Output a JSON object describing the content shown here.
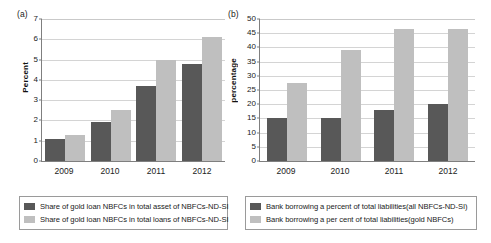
{
  "chart_data": [
    {
      "type": "bar",
      "panel_tag": "(a)",
      "title": "",
      "xlabel": "",
      "ylabel": "Percent",
      "categories": [
        "2009",
        "2010",
        "2011",
        "2012"
      ],
      "ylim": [
        0,
        7
      ],
      "yticks": [
        0,
        1,
        2,
        3,
        4,
        5,
        6,
        7
      ],
      "grid": true,
      "legend_position": "bottom",
      "colors": [
        "#585858",
        "#bfbfbf"
      ],
      "series": [
        {
          "name": "Share of gold loan NBFCs in total asset of NBFCs-ND-SI",
          "values": [
            1.1,
            1.9,
            3.7,
            4.8
          ]
        },
        {
          "name": "Share of gold loan NBFCs in total loans of NBFCs-ND-SI",
          "values": [
            1.3,
            2.5,
            5.0,
            6.1
          ]
        }
      ]
    },
    {
      "type": "bar",
      "panel_tag": "(b)",
      "title": "",
      "xlabel": "",
      "ylabel": "percentage",
      "categories": [
        "2009",
        "2010",
        "2011",
        "2012"
      ],
      "ylim": [
        0,
        50
      ],
      "yticks": [
        0,
        5,
        10,
        15,
        20,
        25,
        30,
        35,
        40,
        45,
        50
      ],
      "grid": true,
      "legend_position": "bottom",
      "colors": [
        "#585858",
        "#bfbfbf"
      ],
      "series": [
        {
          "name": "Bank borrowing a percent of total liabilities(all  NBFCs-ND-SI)",
          "values": [
            15,
            15,
            18,
            20
          ]
        },
        {
          "name": "Bank borrowing a per cent of total liabilities(gold NBFCs)",
          "values": [
            27.5,
            39,
            46.5,
            46.5
          ]
        }
      ]
    }
  ]
}
